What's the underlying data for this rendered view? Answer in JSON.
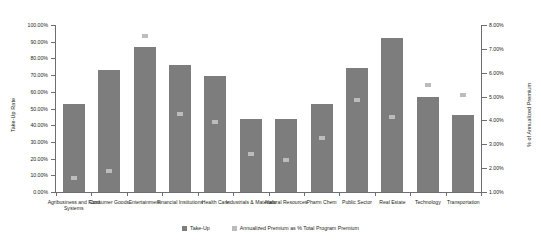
{
  "chart_data": {
    "type": "bar",
    "title": "",
    "subtitle": "",
    "xlabel": "",
    "ylabel": "Take-Up Rate",
    "y2label": "% of Annualized Premium",
    "grid": false,
    "legend_position": "bottom",
    "categories": [
      "Agribusiness and Food Systems",
      "Consumer Goods",
      "Entertainment",
      "Financial Institutions",
      "Health Care",
      "Industrials & Materials",
      "Natural Resources",
      "Pharm Chem",
      "Public Sector",
      "Real Estate",
      "Technology",
      "Transportation"
    ],
    "ylim": [
      0,
      100
    ],
    "y2lim": [
      1,
      8
    ],
    "yticks": [
      "0.00%",
      "10.00%",
      "20.00%",
      "30.00%",
      "40.00%",
      "50.00%",
      "60.00%",
      "70.00%",
      "80.00%",
      "90.00%",
      "100.00%"
    ],
    "y2ticks": [
      "1.00%",
      "2.00%",
      "3.00%",
      "4.00%",
      "5.00%",
      "6.00%",
      "7.00%",
      "8.00%"
    ],
    "series": [
      {
        "name": "Take-Up",
        "axis": "left",
        "type": "bar",
        "color": "#7d7d7d",
        "values": [
          53.0,
          73.0,
          87.0,
          76.0,
          69.5,
          44.0,
          44.0,
          53.0,
          74.0,
          92.0,
          57.0,
          46.0
        ]
      },
      {
        "name": "Annualized Premium as % Total Program Premium",
        "axis": "right",
        "type": "marker",
        "color": "#bcbcbc",
        "values": [
          1.6,
          1.9,
          7.55,
          4.25,
          3.95,
          2.6,
          2.35,
          3.25,
          4.85,
          4.15,
          5.5,
          5.05
        ]
      }
    ]
  },
  "legend": {
    "items": [
      {
        "label": "Take-Up"
      },
      {
        "label": "Annualized Premium as % Total Program Premium"
      }
    ]
  },
  "axes": {
    "left_title": "Take-Up Rate",
    "right_title": "% of Annualized Premium"
  }
}
